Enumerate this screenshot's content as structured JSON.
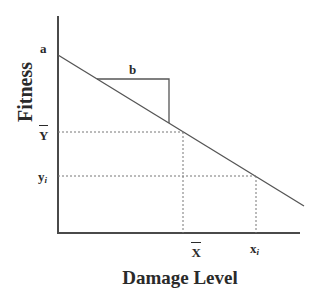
{
  "diagram": {
    "type": "linear fitness vs damage relationship",
    "y_axis_title": "Fitness",
    "x_axis_title": "Damage Level",
    "intercept_label": "a",
    "slope_label": "b",
    "y_mean_label": "Y",
    "y_i_label": "y",
    "y_i_sub": "i",
    "x_mean_label": "X",
    "x_i_label": "x",
    "x_i_sub": "i"
  },
  "colors": {
    "line": "#555555",
    "axis": "#4a4a4a",
    "text": "#2a2a2a",
    "dashed": "#777777"
  }
}
